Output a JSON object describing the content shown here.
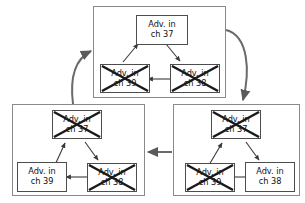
{
  "diagram": {
    "node_label_line1": "Adv. in",
    "colors": {
      "group_border": "#8a8a8a",
      "node_border": "#4d4d4d",
      "arrow": "#555555",
      "cross": "#1a1a1a",
      "background": "#ffffff",
      "text": "#101010"
    },
    "groups": [
      {
        "id": "group-top",
        "name": "group-top",
        "nodes": [
          {
            "id": "top-ch37",
            "line1": "Adv. in",
            "line2": "ch 37",
            "channel": "37",
            "crossed": false
          },
          {
            "id": "top-ch39",
            "line1": "Adv. in",
            "line2": "ch 39",
            "channel": "39",
            "crossed": true
          },
          {
            "id": "top-ch38",
            "line1": "Adv. in",
            "line2": "ch 38",
            "channel": "38",
            "crossed": true
          }
        ],
        "internal_arrows": [
          {
            "from": "top-ch39",
            "to": "top-ch37"
          },
          {
            "from": "top-ch37",
            "to": "top-ch38"
          },
          {
            "from": "top-ch38",
            "to": "top-ch39"
          }
        ]
      },
      {
        "id": "group-bottom-left",
        "name": "group-bottom-left",
        "nodes": [
          {
            "id": "bl-ch37",
            "line1": "Adv. in",
            "line2": "ch 37",
            "channel": "37",
            "crossed": true
          },
          {
            "id": "bl-ch39",
            "line1": "Adv. in",
            "line2": "ch 39",
            "channel": "39",
            "crossed": false
          },
          {
            "id": "bl-ch38",
            "line1": "Adv. in",
            "line2": "ch 38",
            "channel": "38",
            "crossed": true
          }
        ],
        "internal_arrows": [
          {
            "from": "bl-ch39",
            "to": "bl-ch37"
          },
          {
            "from": "bl-ch37",
            "to": "bl-ch38"
          },
          {
            "from": "bl-ch38",
            "to": "bl-ch39"
          }
        ]
      },
      {
        "id": "group-bottom-right",
        "name": "group-bottom-right",
        "nodes": [
          {
            "id": "br-ch37",
            "line1": "Adv. in",
            "line2": "ch 37",
            "channel": "37",
            "crossed": true
          },
          {
            "id": "br-ch39",
            "line1": "Adv. in",
            "line2": "ch 39",
            "channel": "39",
            "crossed": true
          },
          {
            "id": "br-ch38",
            "line1": "Adv. in",
            "line2": "ch 38",
            "channel": "38",
            "crossed": false
          }
        ],
        "internal_arrows": [
          {
            "from": "br-ch39",
            "to": "br-ch37"
          },
          {
            "from": "br-ch37",
            "to": "br-ch38"
          },
          {
            "from": "br-ch38",
            "to": "br-ch39"
          }
        ]
      }
    ],
    "group_arrows": [
      {
        "name": "arrow-top-to-bottom-right",
        "from": "group-top",
        "to": "group-bottom-right",
        "style": "curved"
      },
      {
        "name": "arrow-bottom-right-to-bottom-left",
        "from": "group-bottom-right",
        "to": "group-bottom-left",
        "style": "straight"
      },
      {
        "name": "arrow-bottom-left-to-top",
        "from": "group-bottom-left",
        "to": "group-top",
        "style": "curved"
      }
    ]
  }
}
